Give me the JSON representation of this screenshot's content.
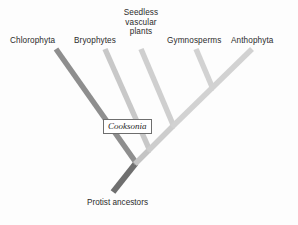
{
  "figure": {
    "type": "cladogram",
    "title": "",
    "background_color": "#fdfdfd",
    "root_label": "Protist ancestors",
    "fossil_marker_label": "Cooksonia"
  },
  "taxa": [
    {
      "id": "chlorophyta",
      "label": "Chlorophyta",
      "branch_color": "#8e8e8e"
    },
    {
      "id": "bryophytes",
      "label": "Bryophytes",
      "branch_color": "#c8c8c8"
    },
    {
      "id": "seedless",
      "label": "Seedless vascular plants",
      "branch_color": "#cfcfcf"
    },
    {
      "id": "gymnosperms",
      "label": "Gymnosperms",
      "branch_color": "#d2d2d2"
    },
    {
      "id": "anthophyta",
      "label": "Anthophyta",
      "branch_color": "#d2d2d2"
    }
  ],
  "colors": {
    "root_stem": "#6f6f6f",
    "chlorophyta_branch": "#8e8e8e",
    "light_branch": "#cfcfcf",
    "box_border": "#6e6e6e",
    "text": "#2b2b2b"
  }
}
